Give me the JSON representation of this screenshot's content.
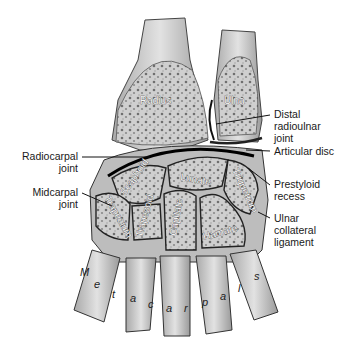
{
  "figure": {
    "colors": {
      "bone_fill": "#c9c9c9",
      "bone_dark": "#7a7a7a",
      "outline": "#1a1a1a",
      "background": "#ffffff"
    }
  },
  "bones": {
    "radius": "Radius",
    "ulna": "Ulna",
    "scaphoid": "Scaphoid",
    "lunate": "Lunate",
    "triquetrum": "Triquetrum",
    "trapezium": "Trapezium",
    "trapezoid": "Trapezoid",
    "capitate": "Capitate",
    "hamate": "Hamate",
    "metacarpals": [
      "M",
      "e",
      "t",
      "a",
      "c",
      "a",
      "r",
      "p",
      "a",
      "l",
      "s"
    ]
  },
  "labels": {
    "left": [
      {
        "id": "radiocarpal",
        "lines": [
          "Radiocarpal",
          "joint"
        ]
      },
      {
        "id": "midcarpal",
        "lines": [
          "Midcarpal",
          "joint"
        ]
      }
    ],
    "right": [
      {
        "id": "distal-radioulnar",
        "lines": [
          "Distal",
          "radioulnar",
          "joint"
        ]
      },
      {
        "id": "articular-disc",
        "lines": [
          "Articular disc"
        ]
      },
      {
        "id": "prestyloid",
        "lines": [
          "Prestyloid",
          "recess"
        ]
      },
      {
        "id": "ulnar-collateral",
        "lines": [
          "Ulnar",
          "collateral",
          "ligament"
        ]
      }
    ]
  }
}
